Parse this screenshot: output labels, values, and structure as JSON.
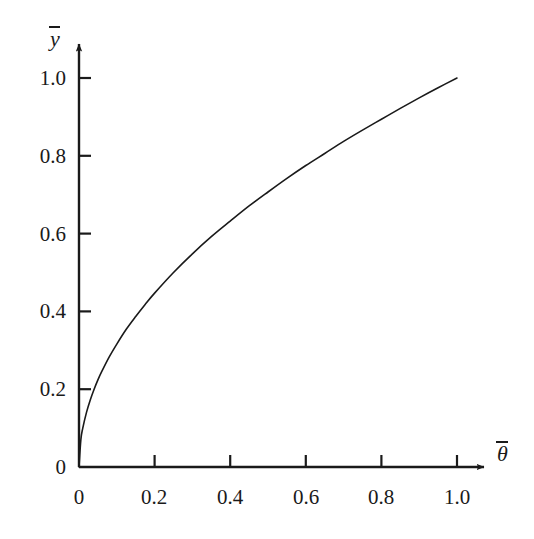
{
  "chart_data": {
    "type": "line",
    "title": "",
    "subtitle": "",
    "xlabel": "θ̄",
    "ylabel": "ȳ",
    "xlabel_base": "θ",
    "ylabel_base": "y",
    "xlim": [
      0,
      1.0
    ],
    "ylim": [
      0,
      1.0
    ],
    "grid": false,
    "legend": null,
    "annotations": [],
    "xticks": [
      0,
      0.2,
      0.4,
      0.6,
      0.8,
      1.0
    ],
    "yticks": [
      0,
      0.2,
      0.4,
      0.6,
      0.8,
      1.0
    ],
    "xtick_labels": [
      "0",
      "0.2",
      "0.4",
      "0.6",
      "0.8",
      "1.0"
    ],
    "ytick_labels": [
      "0",
      "0.2",
      "0.4",
      "0.6",
      "0.8",
      "1.0"
    ],
    "tick_direction": "in",
    "axis_arrows": true,
    "series": [
      {
        "name": "y = sqrt(theta)",
        "relation": "ybar = thetabar^0.5",
        "color": "#1a1a1a",
        "linewidth": 1.6,
        "x": [
          0,
          0.005,
          0.01,
          0.02,
          0.03,
          0.04,
          0.05,
          0.06,
          0.08,
          0.1,
          0.125,
          0.15,
          0.175,
          0.2,
          0.25,
          0.3,
          0.35,
          0.4,
          0.45,
          0.5,
          0.55,
          0.6,
          0.65,
          0.7,
          0.75,
          0.8,
          0.85,
          0.9,
          0.95,
          1.0
        ],
        "y": [
          0,
          0.071,
          0.1,
          0.141,
          0.173,
          0.2,
          0.224,
          0.245,
          0.283,
          0.316,
          0.354,
          0.387,
          0.418,
          0.447,
          0.5,
          0.548,
          0.592,
          0.632,
          0.671,
          0.707,
          0.742,
          0.775,
          0.806,
          0.837,
          0.866,
          0.894,
          0.922,
          0.949,
          0.975,
          1.0
        ]
      }
    ]
  },
  "colors": {
    "background": "#ffffff",
    "axis": "#1a1a1a",
    "curve": "#1a1a1a",
    "text": "#1a1a1a"
  }
}
